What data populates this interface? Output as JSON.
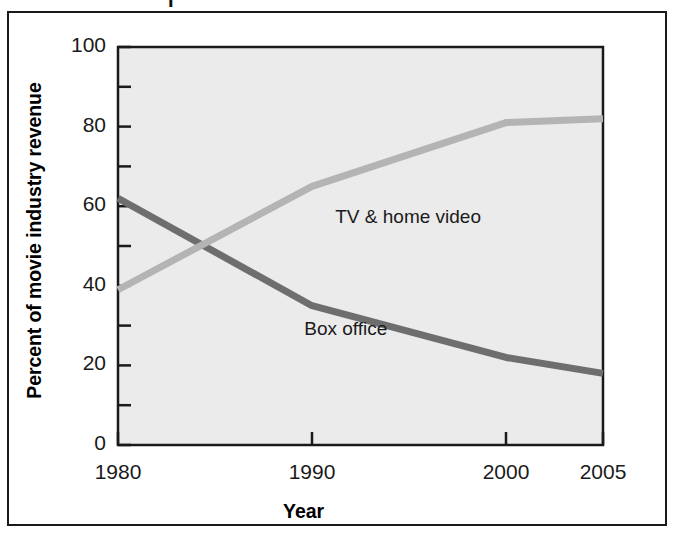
{
  "figure": {
    "background_color": "#ffffff",
    "frame_color": "#1a1a1a",
    "plot_background_color": "#ebebeb",
    "top_fragment": "I"
  },
  "chart_data": {
    "type": "line",
    "title": "",
    "xlabel": "Year",
    "ylabel": "Percent of movie industry revenue",
    "x": [
      1980,
      1990,
      2000,
      2005
    ],
    "xlim": [
      1980,
      2005
    ],
    "ylim": [
      0,
      100
    ],
    "xtick_labels": [
      "1980",
      "1990",
      "2000",
      "2005"
    ],
    "ytick_labels": [
      "0",
      "20",
      "40",
      "60",
      "80",
      "100"
    ],
    "ytick_values": [
      0,
      20,
      40,
      60,
      80,
      100
    ],
    "yminor_values": [
      10,
      30,
      50,
      70,
      90
    ],
    "grid": false,
    "legend_position": "inline-annotations",
    "series": [
      {
        "name": "Box office",
        "color": "#6e6e6e",
        "values": [
          62,
          35,
          22,
          18
        ],
        "label_x": 1989.6,
        "label_y": 29
      },
      {
        "name": "TV & home video",
        "color": "#b4b4b4",
        "values": [
          39,
          65,
          81,
          82
        ],
        "label_x": 1991.2,
        "label_y": 57
      }
    ]
  }
}
